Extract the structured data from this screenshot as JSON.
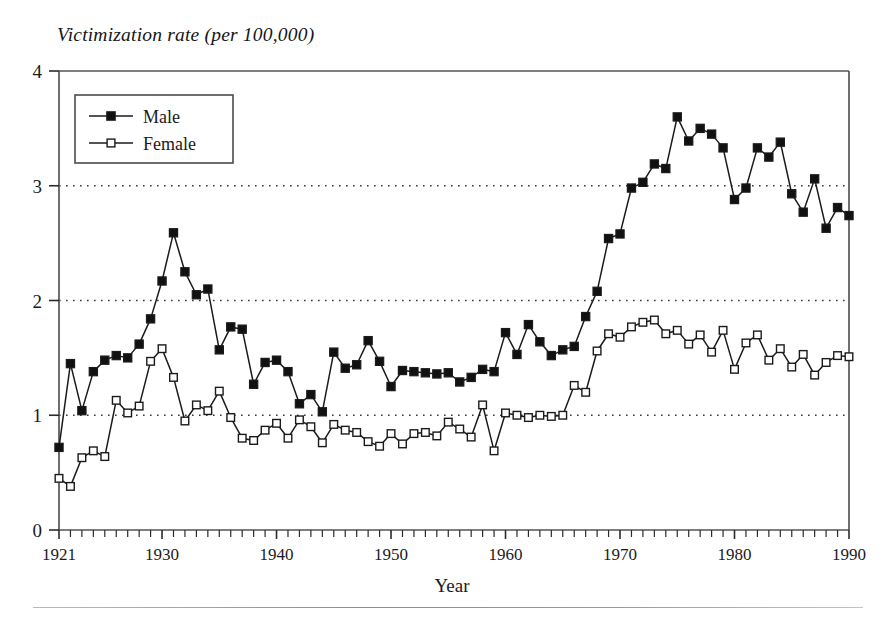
{
  "chart_data": {
    "type": "line",
    "title": "Victimization rate (per 100,000)",
    "xlabel": "Year",
    "ylabel": "",
    "xlim": [
      1921,
      1990
    ],
    "ylim": [
      0,
      4
    ],
    "grid": "horizontal-dotted at 1, 2, 3",
    "legend_position": "top-left inside plot",
    "y_ticks": [
      "0",
      "1",
      "2",
      "3",
      "4"
    ],
    "y_tick_values": [
      0,
      1,
      2,
      3,
      4
    ],
    "x_ticks": [
      "1921",
      "1930",
      "1940",
      "1950",
      "1960",
      "1970",
      "1980",
      "1990"
    ],
    "x_tick_values": [
      1921,
      1930,
      1940,
      1950,
      1960,
      1970,
      1980,
      1990
    ],
    "x_minor_tick_step": 1,
    "x": [
      1921,
      1922,
      1923,
      1924,
      1925,
      1926,
      1927,
      1928,
      1929,
      1930,
      1931,
      1932,
      1933,
      1934,
      1935,
      1936,
      1937,
      1938,
      1939,
      1940,
      1941,
      1942,
      1943,
      1944,
      1945,
      1946,
      1947,
      1948,
      1949,
      1950,
      1951,
      1952,
      1953,
      1954,
      1955,
      1956,
      1957,
      1958,
      1959,
      1960,
      1961,
      1962,
      1963,
      1964,
      1965,
      1966,
      1967,
      1968,
      1969,
      1970,
      1971,
      1972,
      1973,
      1974,
      1975,
      1976,
      1977,
      1978,
      1979,
      1980,
      1981,
      1982,
      1983,
      1984,
      1985,
      1986,
      1987,
      1988,
      1989,
      1990
    ],
    "series": [
      {
        "name": "Male",
        "marker": "filled-square",
        "values": [
          0.72,
          1.45,
          1.04,
          1.38,
          1.48,
          1.52,
          1.5,
          1.62,
          1.84,
          2.17,
          2.59,
          2.25,
          2.05,
          2.1,
          1.57,
          1.77,
          1.75,
          1.27,
          1.46,
          1.48,
          1.38,
          1.1,
          1.18,
          1.03,
          1.55,
          1.41,
          1.44,
          1.65,
          1.47,
          1.25,
          1.39,
          1.38,
          1.37,
          1.36,
          1.37,
          1.29,
          1.33,
          1.4,
          1.38,
          1.72,
          1.53,
          1.79,
          1.64,
          1.52,
          1.57,
          1.6,
          1.86,
          2.08,
          2.54,
          2.58,
          2.98,
          3.03,
          3.19,
          3.15,
          3.6,
          3.39,
          3.5,
          3.45,
          3.33,
          2.88,
          2.98,
          3.33,
          3.25,
          3.38,
          2.93,
          2.77,
          3.06,
          2.63,
          2.81,
          2.74
        ]
      },
      {
        "name": "Female",
        "marker": "open-square",
        "values": [
          0.45,
          0.38,
          0.63,
          0.69,
          0.64,
          1.13,
          1.02,
          1.08,
          1.47,
          1.58,
          1.33,
          0.95,
          1.09,
          1.04,
          1.21,
          0.98,
          0.8,
          0.78,
          0.87,
          0.93,
          0.8,
          0.96,
          0.9,
          0.76,
          0.92,
          0.87,
          0.85,
          0.77,
          0.73,
          0.84,
          0.75,
          0.84,
          0.85,
          0.82,
          0.94,
          0.88,
          0.81,
          1.09,
          0.69,
          1.02,
          1.0,
          0.98,
          1.0,
          0.99,
          1.0,
          1.26,
          1.2,
          1.56,
          1.71,
          1.68,
          1.77,
          1.81,
          1.83,
          1.71,
          1.74,
          1.62,
          1.7,
          1.55,
          1.74,
          1.4,
          1.63,
          1.7,
          1.48,
          1.58,
          1.42,
          1.53,
          1.35,
          1.46,
          1.52,
          1.51
        ]
      }
    ]
  },
  "legend": {
    "entries": [
      {
        "label": "Male"
      },
      {
        "label": "Female"
      }
    ]
  },
  "style": {
    "line_color": "#1b1b1b",
    "marker_fill_male": "#111111",
    "marker_fill_female": "#ffffff",
    "grid_color": "#3a3a3a",
    "frame_color": "#555555",
    "background": "#ffffff"
  }
}
